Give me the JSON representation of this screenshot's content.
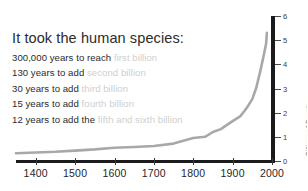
{
  "caption": {
    "heading": "It took the human species:",
    "lines": [
      {
        "lead": "300,000 years to reach ",
        "faded": "first billion"
      },
      {
        "lead": "130 years to add ",
        "faded": "second billion"
      },
      {
        "lead": "30 years to add ",
        "faded": "third billion"
      },
      {
        "lead": "15 years to add ",
        "faded": "fourth billion"
      },
      {
        "lead": "12 years to add the ",
        "faded": "fifth and sixth billion"
      }
    ]
  },
  "colors": {
    "curve": "#a8a8a8",
    "axis": "#1b1b1b",
    "text": "#2b2b2b",
    "faded_text": "#cfcfcf",
    "axis_title": "#6a6a6a"
  },
  "chart_data": {
    "type": "line",
    "title": "",
    "xlabel": "",
    "ylabel": "Billions of People",
    "xlim": [
      1350,
      2000
    ],
    "ylim": [
      0,
      6
    ],
    "grid": false,
    "legend": false,
    "xticks": [
      1400,
      1500,
      1600,
      1700,
      1800,
      1900,
      2000
    ],
    "xtick_labels": [
      "1400",
      "1500",
      "1600",
      "1700",
      "1800",
      "1900",
      "2000"
    ],
    "yticks": [
      0,
      1,
      2,
      3,
      4,
      5,
      6
    ],
    "ytick_labels": [
      "0",
      "1",
      "2",
      "3",
      "4",
      "5",
      "6"
    ],
    "series": [
      {
        "name": "World population",
        "x": [
          1350,
          1400,
          1450,
          1500,
          1550,
          1600,
          1650,
          1700,
          1750,
          1800,
          1830,
          1850,
          1870,
          1900,
          1920,
          1930,
          1940,
          1950,
          1960,
          1970,
          1975,
          1980,
          1985,
          1987
        ],
        "values": [
          0.32,
          0.35,
          0.38,
          0.43,
          0.48,
          0.55,
          0.58,
          0.62,
          0.72,
          0.95,
          1.0,
          1.2,
          1.32,
          1.65,
          1.86,
          2.07,
          2.3,
          2.56,
          3.03,
          3.7,
          4.07,
          4.45,
          4.85,
          5.3
        ]
      }
    ],
    "annotations": [
      "300,000 years to reach first billion",
      "130 years to add second billion",
      "30 years to add third billion",
      "15 years to add fourth billion",
      "12 years to add the fifth and sixth billion"
    ]
  }
}
